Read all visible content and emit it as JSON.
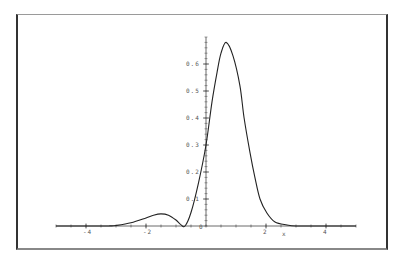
{
  "chart_data": {
    "type": "line",
    "title": "",
    "xlabel": "x",
    "ylabel": "",
    "xlim": [
      -5,
      5
    ],
    "ylim": [
      0,
      0.7
    ],
    "grid": false,
    "legend": null,
    "x_ticks": [
      -4,
      -2,
      0,
      2,
      4
    ],
    "x_tick_labels": [
      "-4",
      "-2",
      "0",
      "2",
      "4"
    ],
    "y_ticks": [
      0.1,
      0.2,
      0.3,
      0.4,
      0.5,
      0.6
    ],
    "y_tick_labels": [
      "0.1",
      "0.2",
      "0.3",
      "0.4",
      "0.5",
      "0.6"
    ],
    "origin_label": "0",
    "series": [
      {
        "name": "f(x)",
        "color": "#222222",
        "x": [
          -5,
          -3.5,
          -3.2,
          -3.0,
          -2.5,
          -2.0,
          -1.75,
          -1.5,
          -1.25,
          -1.0,
          -0.85,
          -0.7,
          -0.5,
          -0.25,
          0.0,
          0.2,
          0.37,
          0.5,
          0.67,
          0.9,
          1.13,
          1.27,
          1.47,
          1.63,
          1.8,
          2.03,
          2.3,
          2.7,
          3.0,
          3.5,
          5
        ],
        "y": [
          0,
          0,
          0.0005,
          0.002,
          0.012,
          0.03,
          0.04,
          0.045,
          0.04,
          0.022,
          0.006,
          0,
          0.05,
          0.16,
          0.3,
          0.46,
          0.57,
          0.64,
          0.68,
          0.63,
          0.52,
          0.4,
          0.27,
          0.18,
          0.1,
          0.048,
          0.015,
          0.004,
          0,
          0,
          0
        ]
      }
    ]
  },
  "layout": {
    "axis_color": "#444444",
    "curve_color": "#222222"
  }
}
